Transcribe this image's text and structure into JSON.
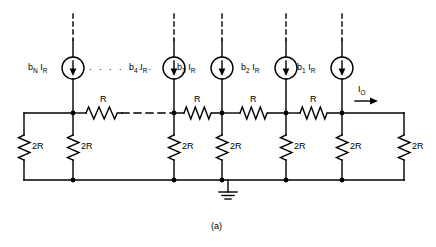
{
  "figure": {
    "caption": "(a)",
    "type": "circuit-schematic"
  },
  "sources": [
    {
      "id": "source-bN",
      "label_main": "b",
      "label_sub": "N",
      "label_unit": "I",
      "label_unit_sub": "R",
      "x": 73
    },
    {
      "id": "source-b4",
      "label_main": "b",
      "label_sub": "4",
      "label_unit": "I",
      "label_unit_sub": "R",
      "x": 174
    },
    {
      "id": "source-b3",
      "label_main": "b",
      "label_sub": "3",
      "label_unit": "I",
      "label_unit_sub": "R",
      "x": 222
    },
    {
      "id": "source-b2",
      "label_main": "b",
      "label_sub": "2",
      "label_unit": "I",
      "label_unit_sub": "R",
      "x": 286
    },
    {
      "id": "source-b1",
      "label_main": "b",
      "label_sub": "1",
      "label_unit": "I",
      "label_unit_sub": "R",
      "x": 342
    }
  ],
  "series_resistors": [
    {
      "id": "series-resistor-1",
      "label": "R"
    },
    {
      "id": "series-resistor-2",
      "label": "R"
    },
    {
      "id": "series-resistor-3",
      "label": "R"
    },
    {
      "id": "series-resistor-4",
      "label": "R"
    }
  ],
  "shunt_resistors": [
    {
      "id": "shunt-resistor-left-termination",
      "label": "2R"
    },
    {
      "id": "shunt-resistor-bN",
      "label": "2R"
    },
    {
      "id": "shunt-resistor-b4",
      "label": "2R"
    },
    {
      "id": "shunt-resistor-b3",
      "label": "2R"
    },
    {
      "id": "shunt-resistor-b2",
      "label": "2R"
    },
    {
      "id": "shunt-resistor-b1",
      "label": "2R"
    },
    {
      "id": "shunt-resistor-right-termination",
      "label": "2R"
    }
  ],
  "output": {
    "label_main": "I",
    "label_sub": "O",
    "direction": "right"
  },
  "ellipsis": {
    "dots": "· · · · · · ·"
  },
  "colors": {
    "wire": "#000000",
    "background": "#ffffff",
    "text": "#000000"
  }
}
